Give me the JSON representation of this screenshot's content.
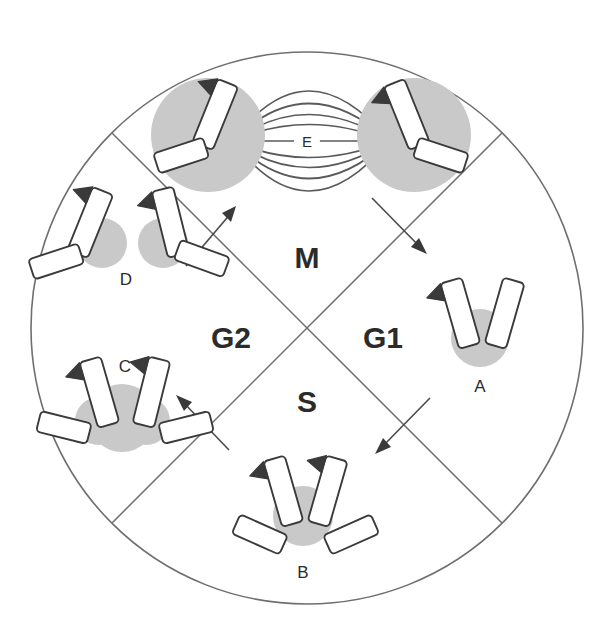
{
  "figure": {
    "type": "circular-phase-diagram"
  },
  "circle": {
    "center_x": 307,
    "center_y": 328,
    "radius": 276,
    "stroke": "#6f6f6f"
  },
  "phases": [
    {
      "id": "M",
      "label": "M",
      "position": "top",
      "x": 307,
      "y": 268
    },
    {
      "id": "G1",
      "label": "G1",
      "position": "right",
      "x": 383,
      "y": 338
    },
    {
      "id": "S",
      "label": "S",
      "position": "bottom",
      "x": 307,
      "y": 402
    },
    {
      "id": "G2",
      "label": "G2",
      "position": "left",
      "x": 231,
      "y": 338
    }
  ],
  "stages": [
    {
      "id": "A",
      "label": "A",
      "x": 478,
      "y": 385,
      "phase": "G1",
      "description": "single unreplicated chromosome"
    },
    {
      "id": "B",
      "label": "B",
      "x": 303,
      "y": 570,
      "phase": "S",
      "description": "chromosome undergoing replication"
    },
    {
      "id": "C",
      "label": "C",
      "x": 125,
      "y": 366,
      "phase": "G2",
      "description": "replicated chromosome with two sister chromatids"
    },
    {
      "id": "D",
      "label": "D",
      "x": 126,
      "y": 279,
      "phase": "M",
      "description": "sister chromatids separating"
    },
    {
      "id": "E",
      "label": "E",
      "x": 307,
      "y": 145,
      "phase": "M",
      "description": "mitotic spindle with two daughter nuclei"
    }
  ],
  "spindle": {
    "pole_left_x": 233,
    "pole_left_y": 141,
    "pole_right_x": 389,
    "pole_right_y": 141,
    "fiber_count": 9,
    "label": "E"
  },
  "nuclei": [
    {
      "id": "nucleus-left",
      "cx": 208,
      "cy": 135,
      "r": 57
    },
    {
      "id": "nucleus-right",
      "cx": 414,
      "cy": 135,
      "r": 57
    }
  ],
  "flow_arrows": [
    {
      "id": "arrow-g2-to-m",
      "direction": "up-right",
      "from_phase": "G2",
      "to_phase": "M"
    },
    {
      "id": "arrow-m-to-g1",
      "direction": "down-right",
      "from_phase": "M",
      "to_phase": "G1"
    },
    {
      "id": "arrow-g1-to-s",
      "direction": "down-left",
      "from_phase": "G1",
      "to_phase": "S"
    },
    {
      "id": "arrow-s-to-g2",
      "direction": "up-left",
      "from_phase": "S",
      "to_phase": "G2"
    }
  ],
  "colors": {
    "outline": "#6f6f6f",
    "chromosome_stroke": "#3a3a3a",
    "chromosome_fill": "#ffffff",
    "nucleus_fill": "#c9c9c9",
    "text": "#2b2b2b",
    "background": "#ffffff"
  }
}
